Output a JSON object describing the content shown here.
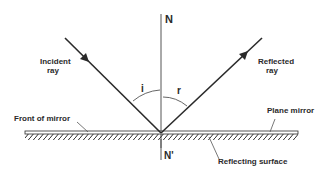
{
  "diagram": {
    "labels": {
      "normal_top": "N",
      "normal_bottom": "N'",
      "incident_ray": [
        "Incident",
        "ray"
      ],
      "reflected_ray": [
        "Reflected",
        "ray"
      ],
      "angle_incidence": "i",
      "angle_reflection": "r",
      "front_of_mirror": "Front of mirror",
      "plane_mirror": "Plane mirror",
      "reflecting_surface": "Reflecting surface"
    },
    "colors": {
      "line": "#2a2a2a",
      "background": "#ffffff"
    }
  }
}
